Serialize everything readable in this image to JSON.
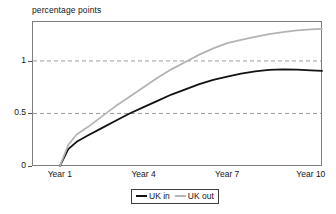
{
  "chart_data": {
    "type": "line",
    "title": "percentage points",
    "ylabel": "percentage points",
    "xlabel": "",
    "grid": true,
    "gridlines_y": [
      0.5,
      1
    ],
    "legend_position": "bottom-center",
    "xlim": [
      0,
      10.4
    ],
    "ylim": [
      0,
      1.38
    ],
    "yticks": [
      0,
      0.5,
      1
    ],
    "ytick_labels": [
      "0",
      "0.5",
      "1"
    ],
    "xticks": [
      1,
      4,
      7,
      10
    ],
    "xtick_labels": [
      "Year 1",
      "Year 4",
      "Year 7",
      "Year 10"
    ],
    "x": [
      1,
      1.3,
      1.6,
      2,
      2.5,
      3,
      3.5,
      4,
      4.5,
      5,
      5.5,
      6,
      6.5,
      7,
      7.5,
      8,
      8.5,
      9,
      9.5,
      10,
      10.4
    ],
    "series": [
      {
        "name": "UK in",
        "color": "#121212",
        "values": [
          0,
          0.16,
          0.23,
          0.29,
          0.36,
          0.43,
          0.5,
          0.56,
          0.62,
          0.68,
          0.73,
          0.78,
          0.82,
          0.85,
          0.88,
          0.9,
          0.915,
          0.92,
          0.918,
          0.91,
          0.905
        ]
      },
      {
        "name": "UK out",
        "color": "#b4b4b4",
        "values": [
          0,
          0.2,
          0.3,
          0.37,
          0.47,
          0.57,
          0.66,
          0.75,
          0.84,
          0.92,
          0.99,
          1.06,
          1.12,
          1.17,
          1.2,
          1.23,
          1.255,
          1.275,
          1.29,
          1.3,
          1.305
        ]
      }
    ]
  },
  "legend": {
    "items": [
      {
        "label": "UK in",
        "color": "#121212"
      },
      {
        "label": "UK out",
        "color": "#b4b4b4"
      }
    ]
  }
}
